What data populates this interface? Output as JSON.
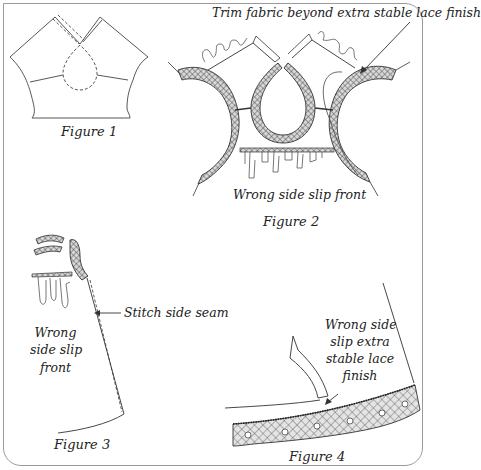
{
  "figures": [
    {
      "id": "figure-1",
      "caption": "Figure 1",
      "annotations": []
    },
    {
      "id": "figure-2",
      "caption": "Figure 2",
      "annotations": [
        "Trim fabric beyond extra stable lace finish",
        "Wrong side slip front"
      ]
    },
    {
      "id": "figure-3",
      "caption": "Figure 3",
      "annotations": [
        "Stitch side seam",
        "Wrong",
        "side slip",
        "front"
      ]
    },
    {
      "id": "figure-4",
      "caption": "Figure 4",
      "annotations": [
        "Wrong side",
        "slip extra",
        "stable lace",
        "finish"
      ]
    }
  ],
  "colors": {
    "frame": "#9a9a9a",
    "ink": "#333333",
    "lace": "#555555"
  }
}
